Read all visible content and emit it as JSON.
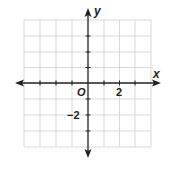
{
  "figure": {
    "type": "coordinate-plane",
    "x_axis_label": "x",
    "y_axis_label": "y",
    "origin_label": "O",
    "x_tick_label": "2",
    "y_tick_label": "−2",
    "x_range": [
      -4,
      4
    ],
    "y_range": [
      -4,
      4
    ],
    "grid_step": 1,
    "colors": {
      "axis": "#231f20",
      "grid": "#cfcfcf",
      "background": "#ffffff"
    }
  }
}
